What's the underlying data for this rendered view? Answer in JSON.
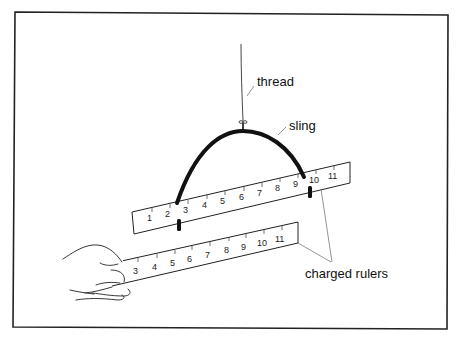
{
  "figure": {
    "labels": {
      "thread": "thread",
      "sling": "sling",
      "charged_rulers": "charged rulers"
    },
    "upper_ruler": {
      "numbers": [
        "1",
        "2",
        "3",
        "4",
        "5",
        "6",
        "7",
        "8",
        "9",
        "10",
        "11"
      ]
    },
    "lower_ruler": {
      "numbers": [
        "3",
        "4",
        "5",
        "6",
        "7",
        "8",
        "9",
        "10",
        "11"
      ]
    },
    "colors": {
      "ink": "#111111",
      "background": "#ffffff",
      "frame": "#222222"
    }
  }
}
